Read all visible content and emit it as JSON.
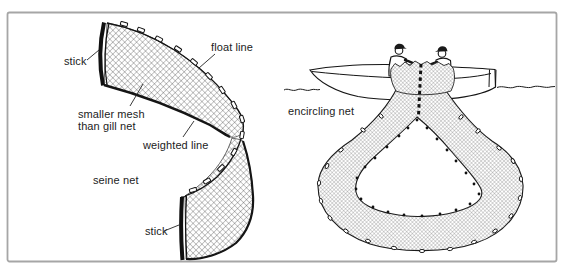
{
  "figure": {
    "seine_panel": {
      "caption": "seine net",
      "labels": {
        "stick_top": "stick",
        "float_line": "float line",
        "smaller_mesh_line1": "smaller mesh",
        "smaller_mesh_line2": "than gill net",
        "weighted_line": "weighted line",
        "stick_bottom": "stick"
      }
    },
    "encircling_panel": {
      "caption": "encircling net"
    }
  },
  "colors": {
    "ink": "#1c1c1c",
    "frame_border": "#a6a6a6",
    "background": "#ffffff"
  }
}
